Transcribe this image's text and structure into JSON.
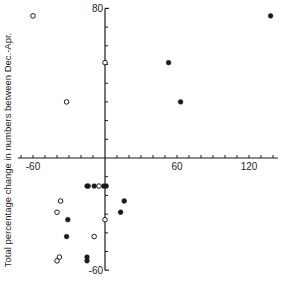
{
  "chart_data": {
    "type": "scatter",
    "title": "",
    "xlabel": "",
    "ylabel": "Total percentage change in numbers between Dec.-Apr.",
    "xlim": [
      -72,
      144
    ],
    "ylim": [
      -60,
      80
    ],
    "x_ticks_step": 10,
    "y_ticks_step": 10,
    "x_tick_labels": [
      {
        "value": -60,
        "label": "-60"
      },
      {
        "value": 60,
        "label": "60"
      },
      {
        "value": 120,
        "label": "120"
      }
    ],
    "y_tick_labels": [
      {
        "value": 80,
        "label": "80"
      },
      {
        "value": -60,
        "label": "-60"
      }
    ],
    "grid": false,
    "axes_cross_at_origin": true,
    "series": [
      {
        "name": "open",
        "marker": "hollow-circle",
        "points": [
          {
            "x": -60,
            "y": 76
          },
          {
            "x": -32,
            "y": 30
          },
          {
            "x": 0,
            "y": 51
          },
          {
            "x": -5,
            "y": -15
          },
          {
            "x": -37,
            "y": -23
          },
          {
            "x": -40,
            "y": -29
          },
          {
            "x": 0,
            "y": -33
          },
          {
            "x": -9,
            "y": -42
          },
          {
            "x": -38,
            "y": -53
          },
          {
            "x": -40,
            "y": -55
          }
        ]
      },
      {
        "name": "filled",
        "marker": "filled-circle",
        "points": [
          {
            "x": 138,
            "y": 76
          },
          {
            "x": 53,
            "y": 51
          },
          {
            "x": 63,
            "y": 30
          },
          {
            "x": -15,
            "y": -15
          },
          {
            "x": -14,
            "y": -15
          },
          {
            "x": -9,
            "y": -15
          },
          {
            "x": -1,
            "y": -15
          },
          {
            "x": 1,
            "y": -15
          },
          {
            "x": 16,
            "y": -23
          },
          {
            "x": 13,
            "y": -29
          },
          {
            "x": -31,
            "y": -33
          },
          {
            "x": -32,
            "y": -42
          },
          {
            "x": -15,
            "y": -53
          },
          {
            "x": -15,
            "y": -55
          }
        ]
      }
    ]
  },
  "colors": {
    "ink": "#1a1a1a",
    "background": "#ffffff"
  }
}
